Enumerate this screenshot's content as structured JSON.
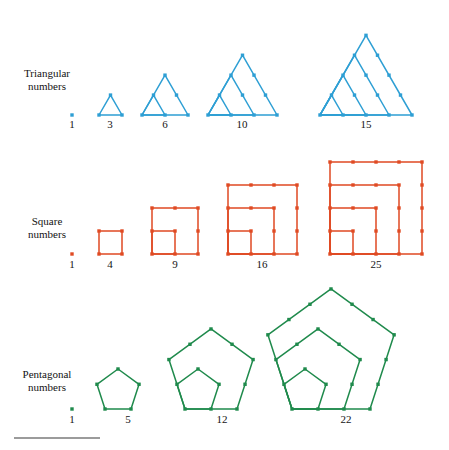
{
  "figure": {
    "background_color": "#ffffff",
    "rule_color": "#9b9b9b"
  },
  "rows": [
    {
      "id": "triangular",
      "label_line1": "Triangular",
      "label_line2": "numbers",
      "color": "#2e9fd4",
      "shape": "triangle",
      "label_x": 47,
      "label_y": 80,
      "baseline_y": 115,
      "number_label_y": 128,
      "figures": [
        {
          "value": "1",
          "n": 1,
          "origin_x": 72,
          "step": 0,
          "label_x": 72
        },
        {
          "value": "3",
          "n": 2,
          "origin_x": 99,
          "step": 23,
          "label_x": 110
        },
        {
          "value": "6",
          "n": 3,
          "origin_x": 142,
          "step": 23,
          "label_x": 165
        },
        {
          "value": "10",
          "n": 4,
          "origin_x": 208,
          "step": 23,
          "label_x": 242
        },
        {
          "value": "15",
          "n": 5,
          "origin_x": 320,
          "step": 23,
          "label_x": 366
        }
      ]
    },
    {
      "id": "square",
      "label_line1": "Square",
      "label_line2": "numbers",
      "color": "#e04a23",
      "shape": "square",
      "label_x": 47,
      "label_y": 228,
      "baseline_y": 254,
      "number_label_y": 268,
      "figures": [
        {
          "value": "1",
          "n": 1,
          "origin_x": 72,
          "step": 0,
          "label_x": 72
        },
        {
          "value": "4",
          "n": 2,
          "origin_x": 99,
          "step": 23,
          "label_x": 110
        },
        {
          "value": "9",
          "n": 3,
          "origin_x": 152,
          "step": 23,
          "label_x": 175
        },
        {
          "value": "16",
          "n": 4,
          "origin_x": 228,
          "step": 23,
          "label_x": 262
        },
        {
          "value": "25",
          "n": 5,
          "origin_x": 330,
          "step": 23,
          "label_x": 376
        }
      ]
    },
    {
      "id": "pentagonal",
      "label_line1": "Pentagonal",
      "label_line2": "numbers",
      "color": "#1f8a4c",
      "shape": "pentagon",
      "label_x": 47,
      "label_y": 381,
      "baseline_y": 409,
      "number_label_y": 423,
      "figures": [
        {
          "value": "1",
          "n": 1,
          "origin_x": 72,
          "step": 0,
          "label_x": 72
        },
        {
          "value": "5",
          "n": 2,
          "origin_x": 105,
          "step": 26,
          "label_x": 128
        },
        {
          "value": "12",
          "n": 3,
          "origin_x": 185,
          "step": 26,
          "label_x": 222
        },
        {
          "value": "22",
          "n": 4,
          "origin_x": 292,
          "step": 26,
          "label_x": 346
        }
      ]
    }
  ],
  "chart_data": {
    "type": "diagram",
    "series": [
      {
        "name": "Triangular numbers",
        "color": "#2e9fd4",
        "values": [
          1,
          3,
          6,
          10,
          15
        ]
      },
      {
        "name": "Square numbers",
        "color": "#e04a23",
        "values": [
          1,
          4,
          9,
          16,
          25
        ]
      },
      {
        "name": "Pentagonal numbers",
        "color": "#1f8a4c",
        "values": [
          1,
          5,
          12,
          22
        ]
      }
    ]
  }
}
